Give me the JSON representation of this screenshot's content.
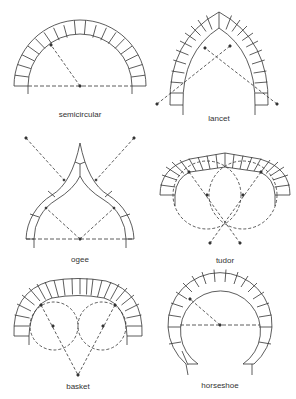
{
  "figure": {
    "arches": [
      {
        "id": "semicircular",
        "label": "semicircular"
      },
      {
        "id": "lancet",
        "label": "lancet"
      },
      {
        "id": "ogee",
        "label": "ogee"
      },
      {
        "id": "tudor",
        "label": "tudor"
      },
      {
        "id": "basket",
        "label": "basket"
      },
      {
        "id": "horseshoe",
        "label": "horseshoe"
      }
    ]
  },
  "colors": {
    "line": "#333333",
    "background": "#ffffff"
  }
}
